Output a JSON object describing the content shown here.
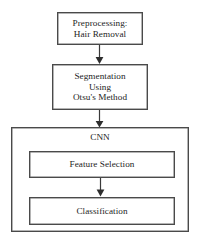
{
  "diagram": {
    "background_color": "#ffffff",
    "line_color": "#4a4a4a",
    "text_color": "#242424"
  },
  "nodes": {
    "preprocessing": {
      "label": "Preprocessing:\nHair Removal",
      "line1": "Preprocessing:",
      "line2": "Hair Removal"
    },
    "segmentation": {
      "label": "Segmentation\nUsing\nOtsu's Method",
      "line1": "Segmentation",
      "line2": "Using",
      "line3": "Otsu's Method"
    },
    "cnn": {
      "label": "CNN"
    },
    "feature_selection": {
      "label": "Feature Selection"
    },
    "classification": {
      "label": "Classification"
    }
  },
  "edges": [
    {
      "name": "preprocessing-to-segmentation",
      "from": "preprocessing",
      "to": "segmentation",
      "style": "solid-arrow-down"
    },
    {
      "name": "segmentation-to-cnn",
      "from": "segmentation",
      "to": "cnn",
      "style": "solid-arrow-down"
    },
    {
      "name": "feature-selection-to-classification",
      "from": "feature_selection",
      "to": "classification",
      "style": "solid-arrow-down"
    }
  ]
}
